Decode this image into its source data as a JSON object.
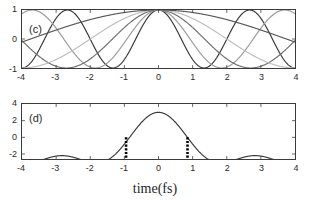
{
  "figure": {
    "background_color": "#ffffff",
    "axis_color": "#3b3b3b",
    "text_color": "#2b2b2b",
    "xlabel": "time(fs)"
  },
  "panel_c": {
    "tag": "(c)",
    "yticks": [
      "1",
      "0",
      "-1"
    ],
    "ytick_values": [
      1,
      0,
      -1
    ],
    "xticks": [
      "-4",
      "-3",
      "-2",
      "-1",
      "0",
      "1",
      "2",
      "3",
      "4"
    ],
    "xtick_values": [
      -4,
      -3,
      -2,
      -1,
      0,
      1,
      2,
      3,
      4
    ]
  },
  "panel_d": {
    "tag": "(d)",
    "yticks": [
      "4",
      "2",
      "0",
      "-2"
    ],
    "ytick_values": [
      4,
      2,
      0,
      -2
    ],
    "xticks": [
      "-4",
      "-3",
      "-2",
      "-1",
      "0",
      "1",
      "2",
      "3",
      "4"
    ],
    "xtick_values": [
      -4,
      -3,
      -2,
      -1,
      0,
      1,
      2,
      3,
      4
    ]
  },
  "chart_data": [
    {
      "type": "line",
      "panel": "(c)",
      "title": "",
      "xlabel": "",
      "ylabel": "",
      "xlim": [
        -4,
        4
      ],
      "ylim": [
        -1,
        1
      ],
      "grid": false,
      "legend": null,
      "description": "Five cosine components of differing periods, all in phase with maxima at t = 0.",
      "series": [
        {
          "name": "component-1",
          "form": "cos(2*pi*t/T)",
          "period": 2.67,
          "color": "#3a3a3a",
          "linewidth": 1.2
        },
        {
          "name": "component-2",
          "form": "cos(2*pi*t/T)",
          "color": "#9a9a9a",
          "period": 3.7,
          "linewidth": 1.2
        },
        {
          "name": "component-3",
          "form": "cos(2*pi*t/T)",
          "color": "#6d6d6d",
          "period": 5.4,
          "linewidth": 1.2
        },
        {
          "name": "component-4",
          "form": "cos(2*pi*t/T)",
          "color": "#bdbdbd",
          "period": 8.0,
          "linewidth": 1.2
        },
        {
          "name": "component-5",
          "form": "cos(2*pi*t/T)",
          "color": "#585858",
          "period": 15.0,
          "linewidth": 1.2
        }
      ]
    },
    {
      "type": "line",
      "panel": "(d)",
      "title": "",
      "xlabel": "time(fs)",
      "ylabel": "",
      "xlim": [
        -4,
        4
      ],
      "ylim": [
        -2.6,
        4
      ],
      "grid": false,
      "legend": null,
      "description": "Coherent sum of the five components in panel (c); central peak near 3 at t = 0 with side lobes near -0.5 around t = -2.85 and t = 2.8, minima near -2 around t = -1.6 and t = 1.6. Two thick dotted vertical markers bracket the main peak.",
      "series": [
        {
          "name": "sum-of-components",
          "color": "#3a3a3a",
          "linewidth": 1.2
        }
      ],
      "annotations": [
        {
          "name": "marker-left",
          "type": "vertical-dotted-line",
          "x": -0.95,
          "y_from": -2.45,
          "y_to": 0.15,
          "color": "#000000"
        },
        {
          "name": "marker-right",
          "type": "vertical-dotted-line",
          "x": 0.85,
          "y_from": -2.45,
          "y_to": 0.15,
          "color": "#000000"
        }
      ]
    }
  ]
}
